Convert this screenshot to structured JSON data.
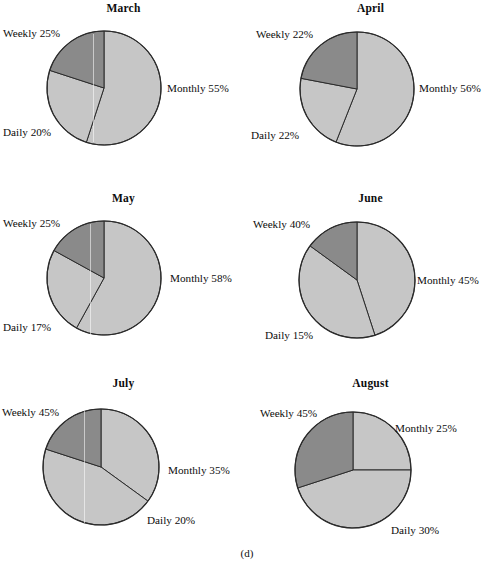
{
  "figure": {
    "caption": "(d)",
    "colors": {
      "monthly_fill": "#c6c6c6",
      "weekly_fill": "#c6c6c6",
      "daily_fill": "#8a8a8a",
      "outline": "#2b2b2b",
      "background": "#ffffff",
      "text": "#0d0d0d"
    }
  },
  "chart_data": [
    {
      "type": "pie",
      "title": "March",
      "categories": [
        "Monthly",
        "Weekly",
        "Daily"
      ],
      "values": [
        55,
        25,
        20
      ],
      "labels": [
        "Monthly 55%",
        "Weekly 25%",
        "Daily 20%"
      ],
      "units": "percent",
      "legend": "labels-outside"
    },
    {
      "type": "pie",
      "title": "April",
      "categories": [
        "Monthly",
        "Weekly",
        "Daily"
      ],
      "values": [
        56,
        22,
        22
      ],
      "labels": [
        "Monthly 56%",
        "Weekly 22%",
        "Daily 22%"
      ],
      "units": "percent",
      "legend": "labels-outside"
    },
    {
      "type": "pie",
      "title": "May",
      "categories": [
        "Monthly",
        "Weekly",
        "Daily"
      ],
      "values": [
        58,
        25,
        17
      ],
      "labels": [
        "Monthly 58%",
        "Weekly 25%",
        "Daily 17%"
      ],
      "units": "percent",
      "legend": "labels-outside"
    },
    {
      "type": "pie",
      "title": "June",
      "categories": [
        "Monthly",
        "Weekly",
        "Daily"
      ],
      "values": [
        45,
        40,
        15
      ],
      "labels": [
        "Monthly 45%",
        "Weekly 40%",
        "Daily 15%"
      ],
      "units": "percent",
      "legend": "labels-outside"
    },
    {
      "type": "pie",
      "title": "July",
      "categories": [
        "Monthly",
        "Weekly",
        "Daily"
      ],
      "values": [
        35,
        45,
        20
      ],
      "labels": [
        "Monthly 35%",
        "Weekly 45%",
        "Daily 20%"
      ],
      "units": "percent",
      "legend": "labels-outside"
    },
    {
      "type": "pie",
      "title": "August",
      "categories": [
        "Monthly",
        "Weekly",
        "Daily"
      ],
      "values": [
        25,
        45,
        30
      ],
      "labels": [
        "Monthly 25%",
        "Weekly 45%",
        "Daily 30%"
      ],
      "units": "percent",
      "legend": "labels-outside"
    }
  ],
  "charts": {
    "march": {
      "title": "March",
      "monthly": "Monthly 55%",
      "weekly": "Weekly 25%",
      "daily": "Daily 20%"
    },
    "april": {
      "title": "April",
      "monthly": "Monthly 56%",
      "weekly": "Weekly 22%",
      "daily": "Daily 22%"
    },
    "may": {
      "title": "May",
      "monthly": "Monthly 58%",
      "weekly": "Weekly 25%",
      "daily": "Daily 17%"
    },
    "june": {
      "title": "June",
      "monthly": "Monthly 45%",
      "weekly": "Weekly 40%",
      "daily": "Daily 15%"
    },
    "july": {
      "title": "July",
      "monthly": "Monthly 35%",
      "weekly": "Weekly 45%",
      "daily": "Daily 20%"
    },
    "august": {
      "title": "August",
      "monthly": "Monthly 25%",
      "weekly": "Weekly 45%",
      "daily": "Daily 30%"
    }
  }
}
